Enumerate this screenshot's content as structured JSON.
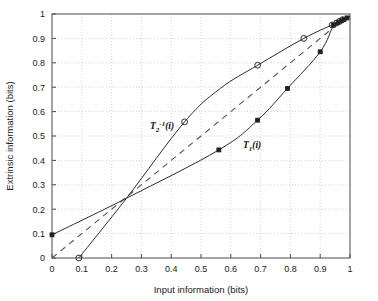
{
  "figure": {
    "title": "",
    "background_color": "#ffffff",
    "axis_color": "#4a4a4a",
    "grid_color": "#b9b9b9",
    "curve_color": "#2b2b2b"
  },
  "axes": {
    "x_label": "Input information (bits)",
    "y_label": "Extrinsic information (bits)",
    "x_ticks": [
      "0",
      "0.1",
      "0.2",
      "0.3",
      "0.4",
      "0.5",
      "0.6",
      "0.7",
      "0.8",
      "0.9",
      "1"
    ],
    "y_ticks": [
      "0",
      "0.1",
      "0.2",
      "0.3",
      "0.4",
      "0.5",
      "0.6",
      "0.7",
      "0.8",
      "0.9",
      "1"
    ]
  },
  "annotations": {
    "t2_label_base": "T",
    "t2_label_sub": "2",
    "t2_label_sup": "-1",
    "t2_label_arg": "(i)",
    "t1_label_base": "T",
    "t1_label_sub": "1",
    "t1_label_arg": "(i)"
  },
  "chart_data": {
    "type": "line",
    "title": "",
    "xlabel": "Input information (bits)",
    "ylabel": "Extrinsic information (bits)",
    "xlim": [
      0,
      1
    ],
    "ylim": [
      0,
      1
    ],
    "xticks": [
      0,
      0.1,
      0.2,
      0.3,
      0.4,
      0.5,
      0.6,
      0.7,
      0.8,
      0.9,
      1
    ],
    "yticks": [
      0,
      0.1,
      0.2,
      0.3,
      0.4,
      0.5,
      0.6,
      0.7,
      0.8,
      0.9,
      1
    ],
    "grid": true,
    "legend": "none",
    "series": [
      {
        "name": "T1(i)",
        "label": "T₁(i)",
        "marker": "filled-square",
        "linestyle": "solid",
        "color": "#2b2b2b",
        "x": [
          0.0,
          0.25,
          0.56,
          0.69,
          0.79,
          0.9,
          0.945,
          0.96,
          0.97,
          0.98,
          0.99,
          1.0
        ],
        "y": [
          0.095,
          0.245,
          0.443,
          0.565,
          0.695,
          0.845,
          0.955,
          0.965,
          0.972,
          0.978,
          0.984,
          0.99
        ]
      },
      {
        "name": "T2^-1(i)",
        "label": "T₂⁻¹(i)",
        "marker": "open-circle",
        "linestyle": "solid",
        "color": "#2b2b2b",
        "x": [
          0.09,
          0.25,
          0.445,
          0.565,
          0.69,
          0.845,
          0.94,
          0.955,
          0.965,
          0.975,
          0.985,
          1.0
        ],
        "y": [
          0.0,
          0.245,
          0.558,
          0.695,
          0.79,
          0.9,
          0.955,
          0.963,
          0.97,
          0.977,
          0.983,
          0.99
        ]
      },
      {
        "name": "reference-diagonal",
        "label": "",
        "marker": "none",
        "linestyle": "dashed",
        "color": "#555555",
        "x": [
          0.0,
          1.0
        ],
        "y": [
          0.0,
          1.0
        ]
      }
    ],
    "markers_T1": [
      {
        "x": 0.0,
        "y": 0.095
      },
      {
        "x": 0.56,
        "y": 0.443
      },
      {
        "x": 0.69,
        "y": 0.565
      },
      {
        "x": 0.79,
        "y": 0.695
      },
      {
        "x": 0.9,
        "y": 0.845
      },
      {
        "x": 0.945,
        "y": 0.955
      },
      {
        "x": 0.96,
        "y": 0.965
      },
      {
        "x": 0.97,
        "y": 0.972
      },
      {
        "x": 0.98,
        "y": 0.978
      },
      {
        "x": 0.99,
        "y": 0.984
      }
    ],
    "markers_T2inv": [
      {
        "x": 0.09,
        "y": 0.0
      },
      {
        "x": 0.445,
        "y": 0.558
      },
      {
        "x": 0.69,
        "y": 0.79
      },
      {
        "x": 0.845,
        "y": 0.9
      },
      {
        "x": 0.94,
        "y": 0.955
      },
      {
        "x": 0.955,
        "y": 0.963
      },
      {
        "x": 0.965,
        "y": 0.97
      },
      {
        "x": 0.975,
        "y": 0.977
      }
    ],
    "annotations": [
      {
        "text": "T₂⁻¹(i)",
        "x": 0.33,
        "y": 0.545
      },
      {
        "text": "T₁(i)",
        "x": 0.645,
        "y": 0.455
      }
    ]
  }
}
